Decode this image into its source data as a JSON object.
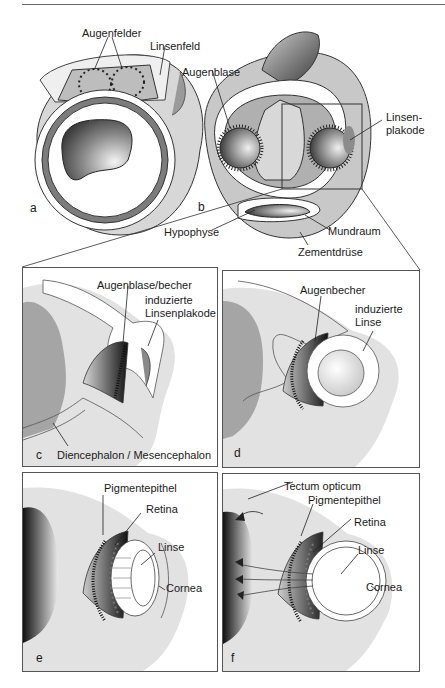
{
  "figure": {
    "top_panels": {
      "a": {
        "letter": "a",
        "labels": {
          "augenfelder": "Augenfelder",
          "linsenfeld": "Linsenfeld"
        }
      },
      "b": {
        "letter": "b",
        "labels": {
          "augenblase": "Augenblase",
          "linsenplakode_line1": "Linsen-",
          "linsenplakode_line2": "plakode",
          "hypophyse": "Hypophyse",
          "mundraum": "Mundraum",
          "zementdruese": "Zementdrüse"
        }
      }
    },
    "detail_panels": {
      "c": {
        "letter": "c",
        "labels": {
          "augenblase_becher": "Augenblase/becher",
          "induzierte": "induzierte",
          "linsenplakode": "Linsenplakode",
          "diencephalon": "Diencephalon / Mesencephalon"
        }
      },
      "d": {
        "letter": "d",
        "labels": {
          "augenbecher": "Augenbecher",
          "induzierte": "induzierte",
          "linse": "Linse"
        }
      },
      "e": {
        "letter": "e",
        "labels": {
          "pigmentepithel": "Pigmentepithel",
          "retina": "Retina",
          "linse": "Linse",
          "cornea": "Cornea"
        }
      },
      "f": {
        "letter": "f",
        "labels": {
          "tectum": "Tectum opticum",
          "pigmentepithel": "Pigmentepithel",
          "retina": "Retina",
          "linse": "Linse",
          "cornea": "Cornea"
        }
      }
    }
  }
}
